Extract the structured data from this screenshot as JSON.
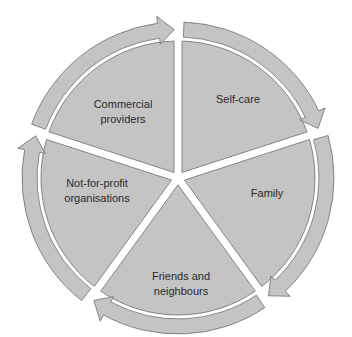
{
  "diagram": {
    "type": "cycle",
    "direction": "clockwise",
    "colors": {
      "fill": "#c4c4c4",
      "stroke": "#6e6e6e",
      "background": "#ffffff",
      "text": "#2a2a2a"
    },
    "segments": [
      {
        "id": "self-care",
        "lines": [
          "Self-care"
        ]
      },
      {
        "id": "family",
        "lines": [
          "Family"
        ]
      },
      {
        "id": "friends",
        "lines": [
          "Friends and",
          "neighbours"
        ]
      },
      {
        "id": "not-for-profit",
        "lines": [
          "Not-for-profit",
          "organisations"
        ]
      },
      {
        "id": "commercial",
        "lines": [
          "Commercial",
          "providers"
        ]
      }
    ]
  }
}
